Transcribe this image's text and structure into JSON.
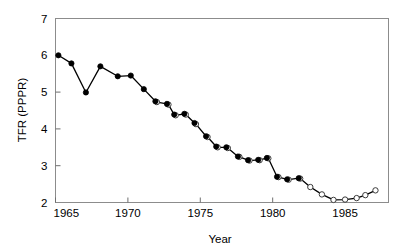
{
  "chart_data": {
    "type": "line",
    "title": "",
    "xlabel": "Year",
    "ylabel": "TFR (PPPR)",
    "xlim": [
      1965,
      1988
    ],
    "ylim": [
      2,
      7
    ],
    "xticks": [
      1965,
      1970,
      1975,
      1980,
      1985
    ],
    "xtick_labels": [
      "1965",
      "1970",
      "1975",
      "1980",
      "1985"
    ],
    "yticks": [
      2,
      3,
      4,
      5,
      6,
      7
    ],
    "ytick_labels": [
      "2",
      "3",
      "4",
      "5",
      "6",
      "7"
    ],
    "grid": false,
    "legend": "none",
    "series": [
      {
        "name": "TFR filled",
        "marker": "filled-circle",
        "x": [
          1965.2,
          1966.1,
          1967.1,
          1968.1,
          1969.3,
          1970.2,
          1971.1,
          1971.9,
          1972.7,
          1973.2,
          1973.9,
          1974.6,
          1975.4,
          1976.1,
          1976.8,
          1977.6,
          1978.3,
          1979.0,
          1979.6,
          1980.3,
          1981.0,
          1981.8
        ],
        "y": [
          6.0,
          5.78,
          4.99,
          5.7,
          5.43,
          5.45,
          5.08,
          4.75,
          4.68,
          4.39,
          4.41,
          4.16,
          3.8,
          3.52,
          3.5,
          3.25,
          3.15,
          3.16,
          3.21,
          2.7,
          2.63,
          2.66
        ]
      },
      {
        "name": "TFR open",
        "marker": "open-circle",
        "x": [
          1972.0,
          1972.8,
          1973.3,
          1974.0,
          1974.7,
          1975.5,
          1976.2,
          1976.9,
          1977.7,
          1978.4,
          1979.1,
          1979.7,
          1980.4,
          1981.1,
          1981.9,
          1982.6,
          1983.4,
          1984.2,
          1985.0,
          1985.8,
          1986.4,
          1987.1
        ],
        "y": [
          4.73,
          4.66,
          4.37,
          4.39,
          4.13,
          3.78,
          3.5,
          3.48,
          3.24,
          3.14,
          3.15,
          3.2,
          2.69,
          2.62,
          2.65,
          2.42,
          2.22,
          2.07,
          2.08,
          2.12,
          2.2,
          2.33
        ]
      }
    ]
  },
  "axes": {
    "x_axis_label": "Year",
    "y_axis_label": "TFR (PPPR)"
  },
  "colors": {
    "line": "#000000",
    "marker_filled": "#000000",
    "marker_open_fill": "#ffffff",
    "marker_open_stroke": "#3a3a3a",
    "frame": "#8c8c8c",
    "background": "#ffffff",
    "text": "#000000"
  }
}
